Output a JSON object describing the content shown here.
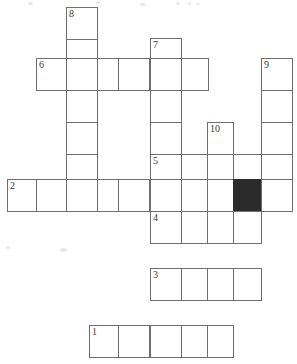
{
  "puzzle": {
    "kind": "crossword-grid",
    "width_px": 297,
    "height_px": 364,
    "cell_size_px": 32,
    "grid_origin_x": 7,
    "grid_origin_y": 7,
    "colors": {
      "background": "#ffffff",
      "cell_fill": "#ffffff",
      "cell_border": "#6e6e6e",
      "blocked_fill": "#2b2b2b",
      "number_text": "#3a3a3a"
    },
    "column_edges_px": [
      7,
      39,
      70,
      102,
      118,
      150,
      181,
      207,
      233,
      262,
      293
    ],
    "row_edges_px": [
      7,
      39,
      58,
      90,
      122,
      154,
      186,
      218,
      236,
      268,
      300,
      326,
      358
    ],
    "clue_numbers": [
      "1",
      "2",
      "3",
      "4",
      "5",
      "6",
      "7",
      "8",
      "9",
      "10"
    ],
    "entries": [
      {
        "number": "1",
        "direction": "across",
        "length": 5,
        "row": 11,
        "col": 3
      },
      {
        "number": "2",
        "direction": "across",
        "length": 9,
        "row": 6,
        "col": 0
      },
      {
        "number": "3",
        "direction": "across",
        "length": 4,
        "row": 9,
        "col": 5
      },
      {
        "number": "4",
        "direction": "across",
        "length": 4,
        "row": 7,
        "col": 5
      },
      {
        "number": "5",
        "direction": "across",
        "length": 5,
        "row": 5,
        "col": 5
      },
      {
        "number": "6",
        "direction": "across",
        "length": 5,
        "row": 2,
        "col": 1
      },
      {
        "number": "7",
        "direction": "down",
        "length": 5,
        "row": 1,
        "col": 5
      },
      {
        "number": "8",
        "direction": "down",
        "length": 6,
        "row": 0,
        "col": 2
      },
      {
        "number": "9",
        "direction": "down",
        "length": 4,
        "row": 2,
        "col": 9
      },
      {
        "number": "10",
        "direction": "down",
        "length": 3,
        "row": 4,
        "col": 7
      }
    ],
    "cells": [
      {
        "name": "cell-r0c2",
        "x": 66,
        "y": 7,
        "w": 32,
        "h": 33,
        "number": "8",
        "blocked": false
      },
      {
        "name": "cell-r1c2",
        "x": 66,
        "y": 39,
        "w": 32,
        "h": 33,
        "number": "",
        "blocked": false
      },
      {
        "name": "cell-r2c7-num7",
        "x": 150,
        "y": 38,
        "w": 32,
        "h": 33,
        "number": "7",
        "blocked": false
      },
      {
        "name": "cell-r3c1",
        "x": 36,
        "y": 58,
        "w": 31,
        "h": 33,
        "number": "6",
        "blocked": false
      },
      {
        "name": "cell-r3c2",
        "x": 66,
        "y": 58,
        "w": 32,
        "h": 33,
        "number": "",
        "blocked": false
      },
      {
        "name": "cell-r3c3",
        "x": 97,
        "y": 58,
        "w": 32,
        "h": 33,
        "number": "",
        "blocked": false
      },
      {
        "name": "cell-r3c4",
        "x": 118,
        "y": 58,
        "w": 32,
        "h": 33,
        "number": "",
        "blocked": false
      },
      {
        "name": "cell-r3c5",
        "x": 150,
        "y": 58,
        "w": 32,
        "h": 33,
        "number": "",
        "blocked": false
      },
      {
        "name": "cell-r3c6",
        "x": 181,
        "y": 58,
        "w": 28,
        "h": 33,
        "number": "",
        "blocked": false
      },
      {
        "name": "cell-r3c9",
        "x": 261,
        "y": 58,
        "w": 32,
        "h": 33,
        "number": "9",
        "blocked": false
      },
      {
        "name": "cell-r4c9",
        "x": 261,
        "y": 90,
        "w": 32,
        "h": 33,
        "number": "",
        "blocked": false
      },
      {
        "name": "cell-r5c9",
        "x": 261,
        "y": 122,
        "w": 32,
        "h": 33,
        "number": "",
        "blocked": false
      },
      {
        "name": "cell-r4c2",
        "x": 66,
        "y": 90,
        "w": 32,
        "h": 33,
        "number": "",
        "blocked": false
      },
      {
        "name": "cell-r5c2",
        "x": 66,
        "y": 122,
        "w": 32,
        "h": 33,
        "number": "",
        "blocked": false
      },
      {
        "name": "cell-r6c2",
        "x": 66,
        "y": 154,
        "w": 32,
        "h": 33,
        "number": "",
        "blocked": false
      },
      {
        "name": "cell-r4c5",
        "x": 150,
        "y": 90,
        "w": 32,
        "h": 33,
        "number": "",
        "blocked": false
      },
      {
        "name": "cell-r5c5",
        "x": 150,
        "y": 122,
        "w": 32,
        "h": 33,
        "number": "",
        "blocked": false
      },
      {
        "name": "cell-r5c7-num10",
        "x": 207,
        "y": 122,
        "w": 27,
        "h": 33,
        "number": "10",
        "blocked": false
      },
      {
        "name": "cell-r6c5",
        "x": 150,
        "y": 154,
        "w": 32,
        "h": 33,
        "number": "5",
        "blocked": false
      },
      {
        "name": "cell-r6c6",
        "x": 181,
        "y": 154,
        "w": 27,
        "h": 33,
        "number": "",
        "blocked": false
      },
      {
        "name": "cell-r6c7",
        "x": 207,
        "y": 154,
        "w": 27,
        "h": 33,
        "number": "",
        "blocked": false
      },
      {
        "name": "cell-r6c8",
        "x": 233,
        "y": 154,
        "w": 29,
        "h": 33,
        "number": "",
        "blocked": false
      },
      {
        "name": "cell-r6c9",
        "x": 261,
        "y": 154,
        "w": 32,
        "h": 33,
        "number": "",
        "blocked": false
      },
      {
        "name": "cell-r7c0",
        "x": 7,
        "y": 179,
        "w": 31,
        "h": 33,
        "number": "2",
        "blocked": false
      },
      {
        "name": "cell-r7c1",
        "x": 36,
        "y": 179,
        "w": 31,
        "h": 33,
        "number": "",
        "blocked": false
      },
      {
        "name": "cell-r7c2",
        "x": 66,
        "y": 179,
        "w": 32,
        "h": 33,
        "number": "",
        "blocked": false
      },
      {
        "name": "cell-r7c3",
        "x": 97,
        "y": 179,
        "w": 32,
        "h": 33,
        "number": "",
        "blocked": false
      },
      {
        "name": "cell-r7c4",
        "x": 118,
        "y": 179,
        "w": 32,
        "h": 33,
        "number": "",
        "blocked": false
      },
      {
        "name": "cell-r7c5",
        "x": 150,
        "y": 179,
        "w": 32,
        "h": 33,
        "number": "",
        "blocked": false
      },
      {
        "name": "cell-r7c6",
        "x": 181,
        "y": 179,
        "w": 27,
        "h": 33,
        "number": "",
        "blocked": false
      },
      {
        "name": "cell-r7c7",
        "x": 207,
        "y": 179,
        "w": 27,
        "h": 33,
        "number": "",
        "blocked": false
      },
      {
        "name": "cell-r7c8-blocked",
        "x": 233,
        "y": 179,
        "w": 29,
        "h": 33,
        "number": "",
        "blocked": true
      },
      {
        "name": "cell-r7c9",
        "x": 261,
        "y": 179,
        "w": 32,
        "h": 33,
        "number": "",
        "blocked": false
      },
      {
        "name": "cell-r8c5",
        "x": 150,
        "y": 211,
        "w": 32,
        "h": 33,
        "number": "4",
        "blocked": false
      },
      {
        "name": "cell-r8c6",
        "x": 181,
        "y": 211,
        "w": 27,
        "h": 33,
        "number": "",
        "blocked": false
      },
      {
        "name": "cell-r8c7",
        "x": 207,
        "y": 211,
        "w": 27,
        "h": 33,
        "number": "",
        "blocked": false
      },
      {
        "name": "cell-r8c8",
        "x": 233,
        "y": 211,
        "w": 29,
        "h": 33,
        "number": "",
        "blocked": false
      },
      {
        "name": "cell-r9c5",
        "x": 150,
        "y": 268,
        "w": 32,
        "h": 33,
        "number": "3",
        "blocked": false
      },
      {
        "name": "cell-r9c6",
        "x": 181,
        "y": 268,
        "w": 27,
        "h": 33,
        "number": "",
        "blocked": false
      },
      {
        "name": "cell-r9c7",
        "x": 207,
        "y": 268,
        "w": 27,
        "h": 33,
        "number": "",
        "blocked": false
      },
      {
        "name": "cell-r9c8",
        "x": 233,
        "y": 268,
        "w": 29,
        "h": 33,
        "number": "",
        "blocked": false
      },
      {
        "name": "cell-r10c3",
        "x": 89,
        "y": 325,
        "w": 30,
        "h": 33,
        "number": "1",
        "blocked": false
      },
      {
        "name": "cell-r10c4",
        "x": 118,
        "y": 325,
        "w": 32,
        "h": 33,
        "number": "",
        "blocked": false
      },
      {
        "name": "cell-r10c5",
        "x": 150,
        "y": 325,
        "w": 32,
        "h": 33,
        "number": "",
        "blocked": false
      },
      {
        "name": "cell-r10c6",
        "x": 181,
        "y": 325,
        "w": 27,
        "h": 33,
        "number": "",
        "blocked": false
      },
      {
        "name": "cell-r10c7",
        "x": 207,
        "y": 325,
        "w": 27,
        "h": 33,
        "number": "",
        "blocked": false
      }
    ],
    "noise_specks": [
      {
        "x": 28,
        "y": 2,
        "w": 5,
        "h": 3
      },
      {
        "x": 96,
        "y": 1,
        "w": 4,
        "h": 3
      },
      {
        "x": 140,
        "y": 3,
        "w": 6,
        "h": 3
      },
      {
        "x": 176,
        "y": 2,
        "w": 4,
        "h": 3
      },
      {
        "x": 188,
        "y": 2,
        "w": 3,
        "h": 3
      },
      {
        "x": 196,
        "y": 3,
        "w": 4,
        "h": 2
      },
      {
        "x": 72,
        "y": 12,
        "w": 3,
        "h": 3
      },
      {
        "x": 60,
        "y": 248,
        "w": 7,
        "h": 4
      },
      {
        "x": 6,
        "y": 246,
        "w": 4,
        "h": 3
      }
    ]
  }
}
